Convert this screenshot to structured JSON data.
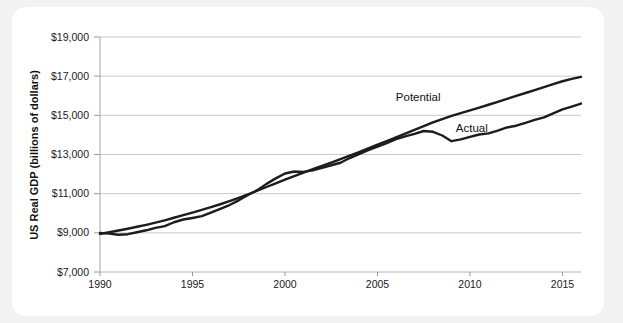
{
  "chart_data": {
    "type": "line",
    "title": "",
    "xlabel": "",
    "ylabel": "US Real GDP (billions of dollars)",
    "xlim": [
      1990,
      2016
    ],
    "ylim": [
      7000,
      19000
    ],
    "grid": true,
    "legend_position": "inline-annotations",
    "y_ticks": [
      7000,
      9000,
      11000,
      13000,
      15000,
      17000,
      19000
    ],
    "y_tick_labels": [
      "$7,000",
      "$9,000",
      "$11,000",
      "$13,000",
      "$15,000",
      "$17,000",
      "$19,000"
    ],
    "x_ticks": [
      1990,
      1995,
      2000,
      2005,
      2010,
      2015
    ],
    "x_tick_labels": [
      "1990",
      "1995",
      "2000",
      "2005",
      "2010",
      "2015"
    ],
    "annotations": [
      {
        "text": "Potential",
        "x": 2007.2,
        "y": 15750
      },
      {
        "text": "Actual",
        "x": 2010.1,
        "y": 14150
      }
    ],
    "x": [
      1990,
      1990.5,
      1991,
      1991.5,
      1992,
      1992.5,
      1993,
      1993.5,
      1994,
      1994.5,
      1995,
      1995.5,
      1996,
      1996.5,
      1997,
      1997.5,
      1998,
      1998.5,
      1999,
      1999.5,
      2000,
      2000.5,
      2001,
      2001.5,
      2002,
      2002.5,
      2003,
      2003.5,
      2004,
      2004.5,
      2005,
      2005.5,
      2006,
      2006.5,
      2007,
      2007.5,
      2008,
      2008.5,
      2009,
      2009.5,
      2010,
      2010.5,
      2011,
      2011.5,
      2012,
      2012.5,
      2013,
      2013.5,
      2014,
      2014.5,
      2015,
      2015.5,
      2016
    ],
    "series": [
      {
        "name": "Potential",
        "values": [
          8950,
          9030,
          9120,
          9210,
          9310,
          9410,
          9520,
          9640,
          9770,
          9900,
          10030,
          10170,
          10310,
          10460,
          10620,
          10790,
          10970,
          11150,
          11340,
          11530,
          11720,
          11900,
          12080,
          12250,
          12420,
          12590,
          12760,
          12940,
          13120,
          13310,
          13500,
          13690,
          13880,
          14070,
          14260,
          14450,
          14640,
          14810,
          14970,
          15110,
          15250,
          15390,
          15540,
          15690,
          15840,
          15990,
          16140,
          16290,
          16440,
          16590,
          16740,
          16860,
          16960
        ]
      },
      {
        "name": "Actual",
        "values": [
          8990,
          8960,
          8900,
          8930,
          9030,
          9130,
          9250,
          9340,
          9540,
          9680,
          9760,
          9850,
          10030,
          10220,
          10420,
          10660,
          10930,
          11180,
          11500,
          11780,
          12030,
          12130,
          12110,
          12190,
          12320,
          12450,
          12580,
          12820,
          13020,
          13220,
          13400,
          13580,
          13790,
          13930,
          14050,
          14200,
          14160,
          13970,
          13680,
          13770,
          13900,
          14020,
          14080,
          14220,
          14380,
          14470,
          14620,
          14770,
          14900,
          15100,
          15300,
          15450,
          15600
        ]
      }
    ]
  },
  "axis": {
    "y_title": "US Real GDP (billions of dollars)"
  }
}
